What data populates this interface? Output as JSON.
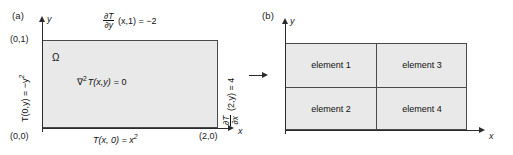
{
  "figure": {
    "panel_a": {
      "label": "(a)",
      "axis_x_name": "x",
      "axis_y_name": "y",
      "domain_symbol": "Ω",
      "governing_equation": {
        "operator": "∇",
        "operator_power": "2",
        "function": "T(x,y)",
        "equals": "= 0",
        "full": "∇2 T(x,y) = 0"
      },
      "corner_labels": [
        {
          "name": "origin",
          "text": "(0,0)"
        },
        {
          "name": "top-left",
          "text": "(0,1)"
        },
        {
          "name": "bottom-right",
          "text": "(2,0)"
        }
      ],
      "bc_top": {
        "numerator": "∂T",
        "denominator": "∂y",
        "rest": "(x,1) = −2",
        "full": "∂T/∂y (x,1) = −2"
      },
      "bc_left": {
        "text_main": "T(0,y) = −y",
        "text_sup": "2",
        "full": "T(0,y) = −y2"
      },
      "bc_right": {
        "numerator": "∂T",
        "denominator": "∂x",
        "rest": "(2,y) = 4",
        "full": "∂T/∂x (2,y) = 4"
      },
      "bc_bottom": {
        "text_main": "T(x, 0) = x",
        "text_sup": "2",
        "full": "T(x, 0) = x2"
      }
    },
    "panel_b": {
      "label": "(b)",
      "axis_x_name": "x",
      "axis_y_name": "y",
      "elements": [
        {
          "name": "element-1",
          "label": "element 1"
        },
        {
          "name": "element-2",
          "label": "element 2"
        },
        {
          "name": "element-3",
          "label": "element 3"
        },
        {
          "name": "element-4",
          "label": "element 4"
        }
      ]
    },
    "colors": {
      "domain_fill": "#e9e9e9",
      "outline": "#4a4a4a",
      "axis": "#2b2b2b",
      "text": "#111111",
      "background": "#ffffff"
    }
  }
}
